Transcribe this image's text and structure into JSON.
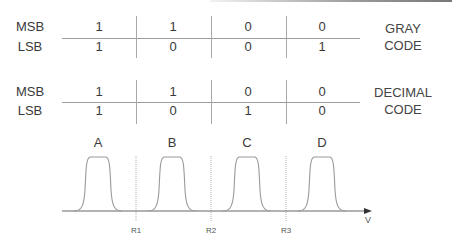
{
  "tables": [
    {
      "name": "gray-code",
      "caption_lines": [
        "GRAY",
        "CODE"
      ],
      "rows": [
        {
          "label": "MSB",
          "values": [
            "1",
            "1",
            "0",
            "0"
          ]
        },
        {
          "label": "LSB",
          "values": [
            "1",
            "0",
            "0",
            "1"
          ]
        }
      ]
    },
    {
      "name": "decimal-code",
      "caption_lines": [
        "DECIMAL",
        "CODE"
      ],
      "rows": [
        {
          "label": "MSB",
          "values": [
            "1",
            "1",
            "0",
            "0"
          ]
        },
        {
          "label": "LSB",
          "values": [
            "1",
            "0",
            "1",
            "0"
          ]
        }
      ]
    }
  ],
  "waveform": {
    "peaks": [
      "A",
      "B",
      "C",
      "D"
    ],
    "thresholds": [
      "R1",
      "R2",
      "R3"
    ],
    "axis_label": "V"
  },
  "colors": {
    "line": "#9c9c9c",
    "text": "#3a3a3a",
    "axis": "#555555"
  }
}
